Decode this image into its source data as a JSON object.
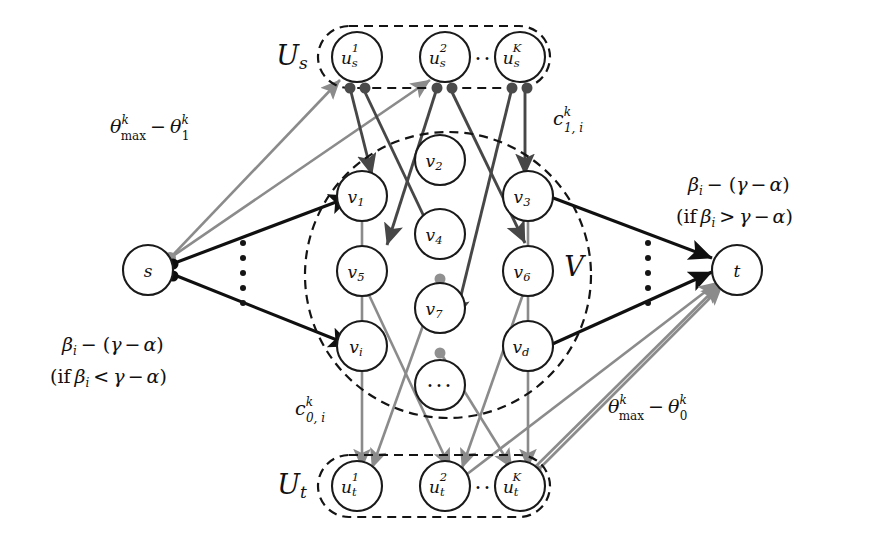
{
  "figure": {
    "type": "flow-network-diagram",
    "background": "#ffffff",
    "edge_colors": {
      "black": "#101010",
      "dark_gray": "#474747",
      "light_gray": "#8b8b8b"
    }
  },
  "groups": {
    "source_group": {
      "label": "U",
      "label_sub": "s",
      "outline": "dashed-rounded-rect",
      "nodes": [
        {
          "id": "us1",
          "base": "u",
          "sub": "s",
          "sup": "1"
        },
        {
          "id": "us2",
          "base": "u",
          "sub": "s",
          "sup": "2"
        },
        {
          "id": "usK",
          "base": "u",
          "sub": "s",
          "sup": "K"
        }
      ],
      "ellipsis": "···"
    },
    "middle_group": {
      "label": "V",
      "outline": "dashed-ellipse",
      "nodes": [
        {
          "id": "v1",
          "base": "v",
          "sub": "1"
        },
        {
          "id": "v2",
          "base": "v",
          "sub": "2"
        },
        {
          "id": "v3",
          "base": "v",
          "sub": "3"
        },
        {
          "id": "v4",
          "base": "v",
          "sub": "4"
        },
        {
          "id": "v5",
          "base": "v",
          "sub": "5"
        },
        {
          "id": "v6",
          "base": "v",
          "sub": "6"
        },
        {
          "id": "v7",
          "base": "v",
          "sub": "7"
        },
        {
          "id": "vi",
          "base": "v",
          "sub": "i"
        },
        {
          "id": "vd",
          "base": "v",
          "sub": "d"
        },
        {
          "id": "vdots",
          "base": "···",
          "sub": ""
        }
      ]
    },
    "sink_group": {
      "label": "U",
      "label_sub": "t",
      "outline": "dashed-rounded-rect",
      "nodes": [
        {
          "id": "ut1",
          "base": "u",
          "sub": "t",
          "sup": "1"
        },
        {
          "id": "ut2",
          "base": "u",
          "sub": "t",
          "sup": "2"
        },
        {
          "id": "utK",
          "base": "u",
          "sub": "t",
          "sup": "K"
        }
      ],
      "ellipsis": "···"
    }
  },
  "terminals": {
    "source": {
      "id": "s",
      "label": "s"
    },
    "sink": {
      "id": "t",
      "label": "t"
    }
  },
  "capacity_labels": {
    "source_to_us": {
      "id": "theta-max-minus-theta1",
      "main": "θ",
      "sup": "k",
      "sub": "max",
      "minus": "−",
      "term2_main": "θ",
      "term2_sup": "k",
      "term2_sub": "1",
      "text": "θᵏₘₐₓ − θᵏ₁"
    },
    "source_to_v": {
      "id": "beta-minus-gamma-alpha-lt",
      "line1": "βᵢ − (γ − α)",
      "line2": "(if βᵢ < γ − α)"
    },
    "v_to_sink": {
      "id": "beta-minus-gamma-alpha-gt",
      "line1": "βᵢ − (γ − α)",
      "line2": "(if βᵢ > γ − α)"
    },
    "us_to_v": {
      "id": "c-one-i-k",
      "main": "c",
      "sup": "k",
      "sub": "1, i",
      "text": "cᵏ₁,ᵢ"
    },
    "v_to_ut": {
      "id": "c-zero-i-k",
      "main": "c",
      "sup": "k",
      "sub": "0, i",
      "text": "cᵏ₀,ᵢ"
    },
    "ut_to_sink": {
      "id": "theta-max-minus-theta0",
      "main": "θ",
      "sup": "k",
      "sub": "max",
      "minus": "−",
      "term2_main": "θ",
      "term2_sup": "k",
      "term2_sub": "0",
      "text": "θᵏₘₐₓ − θᵏ₀"
    }
  },
  "ellipses": {
    "left_vertical_dots": "⋮",
    "right_vertical_dots": "⋮",
    "us_horizontal_dots": "···",
    "ut_horizontal_dots": "···",
    "v_center_dots": "···"
  }
}
